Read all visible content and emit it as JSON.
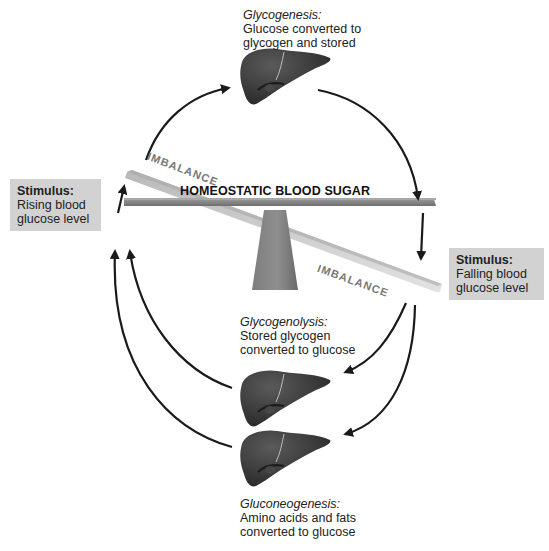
{
  "diagram": {
    "center_label": "HOMEOSTATIC BLOOD SUGAR",
    "imbalance_top": "IMBALANCE",
    "imbalance_bottom": "IMBALANCE",
    "stimulus_left": {
      "title": "Stimulus:",
      "line1": "Rising blood",
      "line2": "glucose level"
    },
    "stimulus_right": {
      "title": "Stimulus:",
      "line1": "Falling blood",
      "line2": "glucose level"
    },
    "glycogenesis": {
      "title": "Glycogenesis:",
      "line1": "Glucose converted to",
      "line2": "glycogen and stored"
    },
    "glycogenolysis": {
      "title": "Glycogenolysis:",
      "line1": "Stored glycogen",
      "line2": "converted to glucose"
    },
    "gluconeogenesis": {
      "title": "Gluconeogenesis:",
      "line1": "Amino acids and fats",
      "line2": "converted to glucose"
    },
    "icons": {
      "organ": "liver-icon",
      "arrow": "curved-arrow-icon",
      "seesaw": "seesaw-lever-icon"
    },
    "colors": {
      "stimulus_box": "#d2d2d2",
      "liver": "#3a3a3a",
      "lever": "#8a8a8a",
      "tilted_lever": "#c8c8c8",
      "arrow": "#1a1a1a"
    }
  }
}
